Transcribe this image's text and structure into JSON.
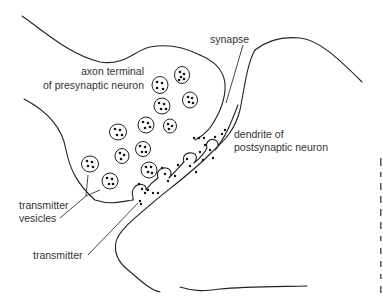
{
  "diagram": {
    "type": "anatomical-illustration",
    "colors": {
      "line": "#222222",
      "text": "#333333",
      "background": "#ffffff"
    },
    "labels": {
      "axon_terminal_line1": "axon terminal",
      "axon_terminal_line2": "of presynaptic neuron",
      "synapse": "synapse",
      "dendrite_line1": "dendrite of",
      "dendrite_line2": "postsynaptic neuron",
      "vesicles_line1": "transmitter",
      "vesicles_line2": "vesicles",
      "transmitter": "transmitter"
    }
  }
}
